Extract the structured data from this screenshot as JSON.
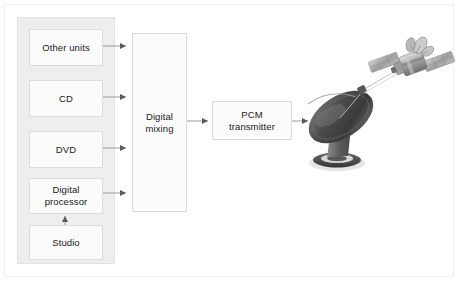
{
  "diagram": {
    "background_color": "#ffffff",
    "frame_color": "#f2f2f2",
    "group_fill": "#eeeeee",
    "box_fill": "#fbfbfb",
    "box_border": "#dcdcdc",
    "text_color": "#202020",
    "connector_color": "#909090",
    "dish_color": "#4a4a4a",
    "satellite_color": "#8a8a8a"
  },
  "source_group": {
    "name": "source-equipment-group",
    "boxes": [
      {
        "id": "other-units",
        "label": "Other units"
      },
      {
        "id": "cd",
        "label": "CD"
      },
      {
        "id": "dvd",
        "label": "DVD"
      },
      {
        "id": "digital-processor",
        "label": "Digital\nprocessor"
      },
      {
        "id": "studio",
        "label": "Studio"
      }
    ]
  },
  "stages": {
    "digital_mixing": {
      "id": "digital-mixing",
      "label": "Digital\nmixing"
    },
    "pcm_transmitter": {
      "id": "pcm-transmitter",
      "label": "PCM\ntransmitter"
    }
  },
  "artwork": {
    "dish": {
      "id": "satellite-dish",
      "label": "satellite-dish"
    },
    "satellite": {
      "id": "satellite",
      "label": "satellite"
    },
    "uplink_beam": {
      "id": "uplink-beam",
      "label": "uplink-beam"
    }
  },
  "connectors": [
    {
      "id": "other-units-to-mixing",
      "from": "other-units",
      "to": "digital-mixing"
    },
    {
      "id": "cd-to-mixing",
      "from": "cd",
      "to": "digital-mixing"
    },
    {
      "id": "dvd-to-mixing",
      "from": "dvd",
      "to": "digital-mixing"
    },
    {
      "id": "digital-processor-to-mixing",
      "from": "digital-processor",
      "to": "digital-mixing"
    },
    {
      "id": "studio-to-digital-processor",
      "from": "studio",
      "to": "digital-processor"
    },
    {
      "id": "mixing-to-pcm-transmitter",
      "from": "digital-mixing",
      "to": "pcm-transmitter"
    },
    {
      "id": "pcm-transmitter-to-dish",
      "from": "pcm-transmitter",
      "to": "satellite-dish"
    },
    {
      "id": "dish-to-satellite",
      "from": "satellite-dish",
      "to": "satellite"
    }
  ]
}
